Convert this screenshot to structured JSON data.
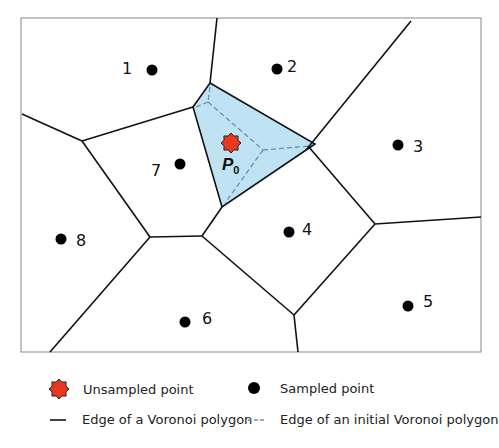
{
  "diagram": {
    "frame": {
      "x": 21,
      "y": 18,
      "width": 460,
      "height": 334
    },
    "colors": {
      "edge": "#111111",
      "frame": "#888888",
      "polygon_fill": "#bfe3f3",
      "dashed_edge": "#6f8fae",
      "unsampled_point": "#e8391f",
      "sampled_point": "#000000"
    },
    "unsampled_point": {
      "label": "P",
      "subscript": "0",
      "x": 231,
      "y": 143
    },
    "sampled_points": [
      {
        "label": "1",
        "x": 152,
        "y": 70,
        "lx": 127,
        "ly": 68
      },
      {
        "label": "2",
        "x": 277,
        "y": 69,
        "lx": 292,
        "ly": 66
      },
      {
        "label": "3",
        "x": 398,
        "y": 145,
        "lx": 418,
        "ly": 146
      },
      {
        "label": "4",
        "x": 289,
        "y": 232,
        "lx": 307,
        "ly": 229
      },
      {
        "label": "5",
        "x": 408,
        "y": 306,
        "lx": 428,
        "ly": 301
      },
      {
        "label": "6",
        "x": 185,
        "y": 322,
        "lx": 207,
        "ly": 318
      },
      {
        "label": "7",
        "x": 180,
        "y": 164,
        "lx": 156,
        "ly": 170
      },
      {
        "label": "8",
        "x": 61,
        "y": 239,
        "lx": 81,
        "ly": 240
      }
    ]
  },
  "legend": {
    "unsampled": "Unsampled point",
    "sampled": "Sampled point",
    "edge": "Edge of a Voronoi polygon",
    "initial_edge": "Edge of an initial Voronoi polygon"
  }
}
